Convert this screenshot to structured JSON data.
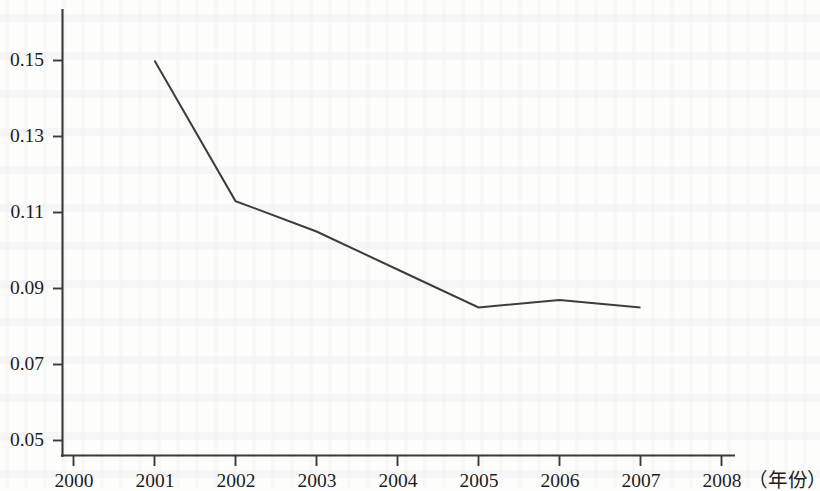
{
  "chart_data": {
    "type": "line",
    "title": "",
    "subtitle": "",
    "xlabel": "（年份）",
    "ylabel": "",
    "x": [
      2001,
      2002,
      2003,
      2004,
      2005,
      2006,
      2007
    ],
    "values": [
      0.15,
      0.113,
      0.105,
      0.095,
      0.085,
      0.087,
      0.085
    ],
    "series": [
      {
        "name": "",
        "x": [
          2001,
          2002,
          2003,
          2004,
          2005,
          2006,
          2007
        ],
        "values": [
          0.15,
          0.113,
          0.105,
          0.095,
          0.085,
          0.087,
          0.085
        ]
      }
    ],
    "xlim": [
      2000,
      2008
    ],
    "ylim": [
      0.05,
      0.157
    ],
    "x_tick_labels": [
      "2000",
      "2001",
      "2002",
      "2003",
      "2004",
      "2005",
      "2006",
      "2007",
      "2008"
    ],
    "x_ticks": [
      2000,
      2001,
      2002,
      2003,
      2004,
      2005,
      2006,
      2007,
      2008
    ],
    "y_tick_labels": [
      "0.05",
      "0.07",
      "0.09",
      "0.11",
      "0.13",
      "0.15"
    ],
    "y_ticks": [
      0.05,
      0.07,
      0.09,
      0.11,
      0.13,
      0.15
    ],
    "grid": false,
    "legend": null,
    "legend_position": "none",
    "annotations": [],
    "line_color": "#3d3d3d",
    "axis_color": "#3a3a3a",
    "markers": false
  },
  "axis_unit": {
    "text": "（年份）"
  }
}
